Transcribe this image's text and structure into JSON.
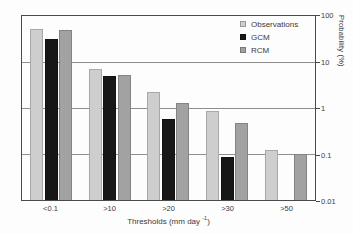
{
  "chart_data": {
    "type": "bar",
    "title": "",
    "yscale": "log",
    "categories": [
      "<0.1",
      ">10",
      ">20",
      ">30",
      ">50"
    ],
    "series": [
      {
        "name": "Observations",
        "color": "#cecece",
        "values": [
          52,
          7,
          2.2,
          0.84,
          0.125
        ]
      },
      {
        "name": "GCM",
        "color": "#171717",
        "values": [
          31,
          4.9,
          0.58,
          0.085,
          null
        ]
      },
      {
        "name": "RCM",
        "color": "#a2a2a2",
        "values": [
          49,
          5.3,
          1.3,
          0.48,
          0.1
        ]
      }
    ],
    "xlabel": "Thresholds (mm day⁻¹)",
    "xlabel_parts": {
      "prefix": "Thresholds (mm day ",
      "superscript": "-1",
      "suffix": ")"
    },
    "ylabel": "Probability (%)",
    "ylim": [
      0.01,
      100
    ],
    "yticks": [
      "100",
      "10",
      "1",
      "0.1",
      "0.01"
    ],
    "gridlines": [
      10,
      1,
      0.1
    ],
    "grid": true,
    "legend_position": "top-right",
    "axis_color": "#4a4a4a",
    "gridline_color": "#8f8f8f",
    "text_color": "#3a3a3a"
  }
}
